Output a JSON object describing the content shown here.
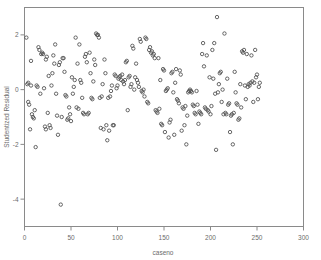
{
  "chart_data": {
    "type": "scatter",
    "title": "",
    "xlabel": "caseno",
    "ylabel": "Studentized Residual",
    "xlim": [
      0,
      300
    ],
    "ylim": [
      -5.0,
      3.0
    ],
    "xticks": [
      0,
      50,
      100,
      150,
      200,
      250,
      300
    ],
    "xticklabels": [
      "0",
      "50",
      "100",
      "150",
      "200",
      "250",
      "300"
    ],
    "yticks": [
      2,
      0,
      -2,
      -4
    ],
    "yticklabels": [
      "2",
      "0",
      "-2",
      "-4"
    ],
    "grid": false,
    "legend": null,
    "marker": "open-circle",
    "marker_color": "#555555",
    "axis_color": "#8a8a8a",
    "text_color": "#6b6b6b",
    "series": [
      {
        "name": "residuals",
        "points": [
          [
            2,
            1.9
          ],
          [
            3,
            0.2
          ],
          [
            4,
            0.25
          ],
          [
            4,
            -0.45
          ],
          [
            5,
            -0.55
          ],
          [
            6,
            -1.45
          ],
          [
            7,
            0.15
          ],
          [
            7,
            1.05
          ],
          [
            8,
            -0.9
          ],
          [
            9,
            -1.0
          ],
          [
            10,
            -1.05
          ],
          [
            11,
            -0.75
          ],
          [
            12,
            -2.1
          ],
          [
            13,
            0.15
          ],
          [
            14,
            0.1
          ],
          [
            15,
            1.55
          ],
          [
            16,
            1.45
          ],
          [
            17,
            -0.15
          ],
          [
            18,
            1.3
          ],
          [
            19,
            1.35
          ],
          [
            20,
            1.3
          ],
          [
            21,
            0.05
          ],
          [
            22,
            -1.35
          ],
          [
            23,
            -1.45
          ],
          [
            23,
            1.1
          ],
          [
            24,
            1.2
          ],
          [
            25,
            -0.85
          ],
          [
            26,
            0.5
          ],
          [
            27,
            -1.3
          ],
          [
            28,
            -1.4
          ],
          [
            29,
            0.15
          ],
          [
            30,
            0.6
          ],
          [
            31,
            1.25
          ],
          [
            32,
            0.95
          ],
          [
            33,
            1.65
          ],
          [
            34,
            -0.15
          ],
          [
            35,
            -0.95
          ],
          [
            36,
            -1.65
          ],
          [
            37,
            0.9
          ],
          [
            38,
            1.0
          ],
          [
            39,
            -4.2
          ],
          [
            40,
            -1.0
          ],
          [
            41,
            1.15
          ],
          [
            42,
            1.15
          ],
          [
            43,
            0.65
          ],
          [
            44,
            -0.2
          ],
          [
            45,
            -0.25
          ],
          [
            46,
            -1.1
          ],
          [
            47,
            -1.05
          ],
          [
            48,
            -0.65
          ],
          [
            49,
            -0.9
          ],
          [
            50,
            -1.15
          ],
          [
            51,
            0.45
          ],
          [
            52,
            -0.15
          ],
          [
            53,
            0.1
          ],
          [
            54,
            0.35
          ],
          [
            55,
            1.9
          ],
          [
            56,
            -0.65
          ],
          [
            57,
            0.95
          ],
          [
            58,
            -0.7
          ],
          [
            59,
            1.65
          ],
          [
            60,
            0.35
          ],
          [
            61,
            0.25
          ],
          [
            62,
            -0.3
          ],
          [
            63,
            -0.85
          ],
          [
            64,
            -0.9
          ],
          [
            65,
            1.2
          ],
          [
            66,
            1.3
          ],
          [
            67,
            1.0
          ],
          [
            68,
            -0.9
          ],
          [
            69,
            -0.85
          ],
          [
            70,
            1.35
          ],
          [
            71,
            0.6
          ],
          [
            72,
            -0.3
          ],
          [
            73,
            -0.35
          ],
          [
            74,
            0.3
          ],
          [
            75,
            1.1
          ],
          [
            76,
            0.9
          ],
          [
            77,
            2.05
          ],
          [
            78,
            2.0
          ],
          [
            79,
            2.0
          ],
          [
            80,
            1.9
          ],
          [
            81,
            -0.3
          ],
          [
            82,
            -1.4
          ],
          [
            83,
            -0.25
          ],
          [
            84,
            0.2
          ],
          [
            85,
            -1.45
          ],
          [
            86,
            1.1
          ],
          [
            87,
            0.6
          ],
          [
            88,
            -1.3
          ],
          [
            89,
            -1.85
          ],
          [
            90,
            -0.3
          ],
          [
            91,
            -1.5
          ],
          [
            92,
            -0.25
          ],
          [
            93,
            -0.05
          ],
          [
            94,
            0.15
          ],
          [
            95,
            -1.3
          ],
          [
            96,
            -1.3
          ],
          [
            97,
            0.55
          ],
          [
            98,
            0.5
          ],
          [
            99,
            0.05
          ],
          [
            100,
            0.15
          ],
          [
            101,
            0.4
          ],
          [
            102,
            0.45
          ],
          [
            103,
            0.5
          ],
          [
            104,
            0.35
          ],
          [
            105,
            0.55
          ],
          [
            106,
            0.3
          ],
          [
            107,
            0.2
          ],
          [
            108,
            0.35
          ],
          [
            109,
            1.0
          ],
          [
            110,
            1.05
          ],
          [
            111,
            -0.75
          ],
          [
            112,
            0.45
          ],
          [
            113,
            0.5
          ],
          [
            114,
            0.1
          ],
          [
            115,
            0.2
          ],
          [
            116,
            1.6
          ],
          [
            117,
            1.5
          ],
          [
            118,
            0.0
          ],
          [
            119,
            0.45
          ],
          [
            120,
            0.95
          ],
          [
            121,
            0.35
          ],
          [
            122,
            0.25
          ],
          [
            123,
            0.1
          ],
          [
            124,
            1.85
          ],
          [
            125,
            1.75
          ],
          [
            126,
            -0.05
          ],
          [
            127,
            -0.1
          ],
          [
            128,
            0.0
          ],
          [
            129,
            -0.25
          ],
          [
            130,
            1.9
          ],
          [
            131,
            1.85
          ],
          [
            132,
            -0.45
          ],
          [
            133,
            -0.5
          ],
          [
            134,
            1.45
          ],
          [
            135,
            1.55
          ],
          [
            136,
            1.35
          ],
          [
            137,
            1.4
          ],
          [
            138,
            1.25
          ],
          [
            139,
            1.3
          ],
          [
            140,
            1.15
          ],
          [
            141,
            -0.75
          ],
          [
            142,
            -0.8
          ],
          [
            143,
            -0.85
          ],
          [
            144,
            1.15
          ],
          [
            145,
            -0.7
          ],
          [
            146,
            0.35
          ],
          [
            147,
            -1.25
          ],
          [
            148,
            -1.3
          ],
          [
            149,
            0.75
          ],
          [
            150,
            0.7
          ],
          [
            151,
            -1.55
          ],
          [
            152,
            -0.05
          ],
          [
            153,
            0.0
          ],
          [
            154,
            0.05
          ],
          [
            155,
            -1.75
          ],
          [
            156,
            -1.2
          ],
          [
            157,
            -1.1
          ],
          [
            158,
            0.6
          ],
          [
            159,
            0.65
          ],
          [
            160,
            -0.1
          ],
          [
            161,
            -1.65
          ],
          [
            162,
            0.25
          ],
          [
            163,
            0.75
          ],
          [
            164,
            -0.35
          ],
          [
            165,
            -0.4
          ],
          [
            166,
            -0.5
          ],
          [
            167,
            0.7
          ],
          [
            168,
            0.55
          ],
          [
            169,
            -1.5
          ],
          [
            170,
            -0.65
          ],
          [
            171,
            -0.7
          ],
          [
            172,
            -1.3
          ],
          [
            173,
            -0.6
          ],
          [
            174,
            -2.0
          ],
          [
            175,
            -0.95
          ],
          [
            176,
            -0.1
          ],
          [
            177,
            -0.05
          ],
          [
            178,
            0.0
          ],
          [
            179,
            -0.05
          ],
          [
            180,
            -0.1
          ],
          [
            181,
            -0.55
          ],
          [
            182,
            -0.6
          ],
          [
            183,
            -0.85
          ],
          [
            184,
            -0.9
          ],
          [
            185,
            -0.05
          ],
          [
            186,
            -0.55
          ],
          [
            187,
            -1.25
          ],
          [
            188,
            -0.8
          ],
          [
            189,
            -0.85
          ],
          [
            190,
            -0.9
          ],
          [
            191,
            1.3
          ],
          [
            192,
            1.7
          ],
          [
            193,
            0.85
          ],
          [
            194,
            -0.65
          ],
          [
            195,
            -0.7
          ],
          [
            196,
            1.25
          ],
          [
            197,
            -0.75
          ],
          [
            198,
            -0.8
          ],
          [
            199,
            0.45
          ],
          [
            200,
            -0.9
          ],
          [
            201,
            -0.6
          ],
          [
            202,
            1.45
          ],
          [
            203,
            0.4
          ],
          [
            204,
            1.7
          ],
          [
            205,
            -0.15
          ],
          [
            206,
            -2.2
          ],
          [
            207,
            2.65
          ],
          [
            208,
            -0.1
          ],
          [
            209,
            0.2
          ],
          [
            210,
            0.6
          ],
          [
            211,
            0.65
          ],
          [
            212,
            -0.45
          ],
          [
            213,
            0.0
          ],
          [
            214,
            -0.9
          ],
          [
            215,
            2.05
          ],
          [
            216,
            -0.85
          ],
          [
            217,
            -0.9
          ],
          [
            218,
            0.4
          ],
          [
            219,
            -0.55
          ],
          [
            220,
            -0.5
          ],
          [
            221,
            -1.55
          ],
          [
            222,
            -0.95
          ],
          [
            223,
            -0.9
          ],
          [
            224,
            -2.0
          ],
          [
            225,
            -0.85
          ],
          [
            226,
            0.65
          ],
          [
            227,
            -0.1
          ],
          [
            228,
            -0.5
          ],
          [
            229,
            -0.55
          ],
          [
            230,
            -1.1
          ],
          [
            231,
            -1.05
          ],
          [
            232,
            0.2
          ],
          [
            233,
            -0.65
          ],
          [
            234,
            1.4
          ],
          [
            235,
            1.35
          ],
          [
            236,
            1.45
          ],
          [
            237,
            0.15
          ],
          [
            238,
            -0.35
          ],
          [
            239,
            1.3
          ],
          [
            240,
            0.1
          ],
          [
            241,
            0.2
          ],
          [
            242,
            0.15
          ],
          [
            243,
            0.25
          ],
          [
            244,
            1.25
          ],
          [
            245,
            0.3
          ],
          [
            246,
            -0.45
          ],
          [
            247,
            0.25
          ],
          [
            248,
            1.45
          ],
          [
            249,
            0.45
          ],
          [
            250,
            0.55
          ],
          [
            251,
            -0.35
          ],
          [
            252,
            0.1
          ],
          [
            253,
            0.25
          ]
        ]
      }
    ]
  }
}
